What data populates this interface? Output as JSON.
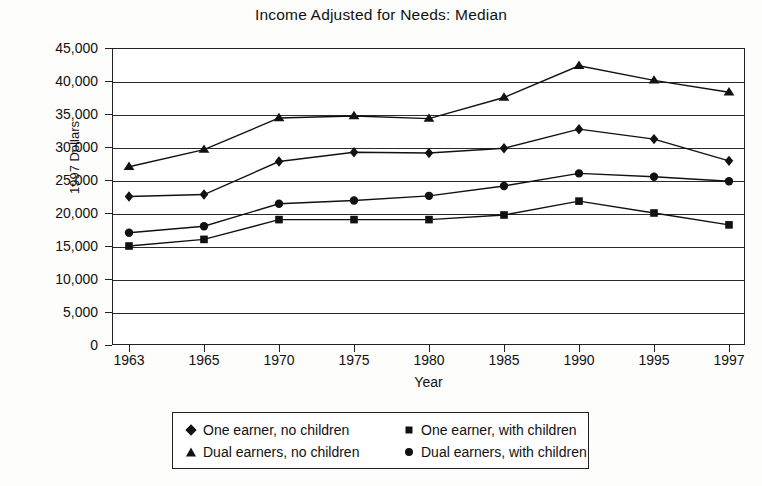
{
  "chart_data": {
    "type": "line",
    "title": "Income Adjusted for Needs: Median",
    "xlabel": "Year",
    "ylabel": "1997 Dollars",
    "categories": [
      "1963",
      "1965",
      "1970",
      "1975",
      "1980",
      "1985",
      "1990",
      "1995",
      "1997"
    ],
    "x": [
      1963,
      1965,
      1970,
      1975,
      1980,
      1985,
      1990,
      1995,
      1997
    ],
    "ylim": [
      0,
      45000
    ],
    "yticks": [
      0,
      5000,
      10000,
      15000,
      20000,
      25000,
      30000,
      35000,
      40000,
      45000
    ],
    "ytick_labels": [
      "0",
      "5,000",
      "10,000",
      "15,000",
      "20,000",
      "25,000",
      "30,000",
      "35,000",
      "40,000",
      "45,000"
    ],
    "grid": true,
    "legend_position": "bottom",
    "series": [
      {
        "name": "One earner, no children",
        "marker": "diamond",
        "values": [
          22500,
          22800,
          27800,
          29200,
          29100,
          29800,
          32700,
          31200,
          27900
        ]
      },
      {
        "name": "One earner, with children",
        "marker": "square",
        "values": [
          15000,
          16000,
          19000,
          19000,
          19000,
          19700,
          21800,
          20000,
          18200
        ]
      },
      {
        "name": "Dual earners, no children",
        "marker": "triangle",
        "values": [
          27000,
          29600,
          34400,
          34700,
          34300,
          37500,
          42300,
          40100,
          38300
        ]
      },
      {
        "name": "Dual earners, with children",
        "marker": "circle",
        "values": [
          17000,
          18000,
          21400,
          21900,
          22600,
          24100,
          26000,
          25500,
          24800
        ]
      }
    ]
  },
  "legend": {
    "entries": [
      {
        "label": "One earner, no children",
        "marker": "diamond"
      },
      {
        "label": "One earner, with children",
        "marker": "square"
      },
      {
        "label": "Dual earners, no children",
        "marker": "triangle"
      },
      {
        "label": "Dual earners, with children",
        "marker": "circle"
      }
    ]
  }
}
